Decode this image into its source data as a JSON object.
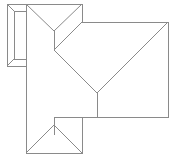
{
  "diagram": {
    "type": "roof-plan",
    "line_color": "#8a8a8a",
    "background": "#ffffff",
    "elements": [
      {
        "name": "side-wing-outer",
        "shape": "rect"
      },
      {
        "name": "side-wing-inner",
        "shape": "rect"
      },
      {
        "name": "left-wing-upper-hip"
      },
      {
        "name": "main-block-hip"
      },
      {
        "name": "front-gable-hip"
      }
    ]
  }
}
